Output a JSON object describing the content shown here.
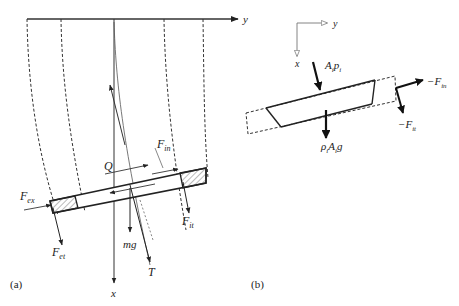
{
  "panel_a": {
    "caption": "(a)",
    "axes": {
      "horizontal": "y",
      "vertical": "x"
    },
    "labels": {
      "Q": "Q",
      "F_in": "F",
      "F_in_sub": "in",
      "F_ex": "F",
      "F_ex_sub": "ex",
      "F_et": "F",
      "F_et_sub": "et",
      "F_it": "F",
      "F_it_sub": "it",
      "mg": "mg",
      "T": "T"
    }
  },
  "panel_b": {
    "caption": "(b)",
    "axes": {
      "horizontal": "y",
      "vertical": "x"
    },
    "labels": {
      "A_i_p_i": "A",
      "A_i_p_i_sub1": "i",
      "p": "p",
      "p_sub": "i",
      "rho_A_g_rho": "ρ",
      "rho_sub": "i",
      "rho_A": "A",
      "rho_A_sub": "i",
      "rho_g": "g",
      "neg_F_in": "−F",
      "neg_F_in_sub": "in",
      "neg_F_it": "−F",
      "neg_F_it_sub": "it"
    }
  },
  "colors": {
    "stroke": "#222222",
    "light_stroke": "#888888",
    "hatch": "#666666"
  }
}
